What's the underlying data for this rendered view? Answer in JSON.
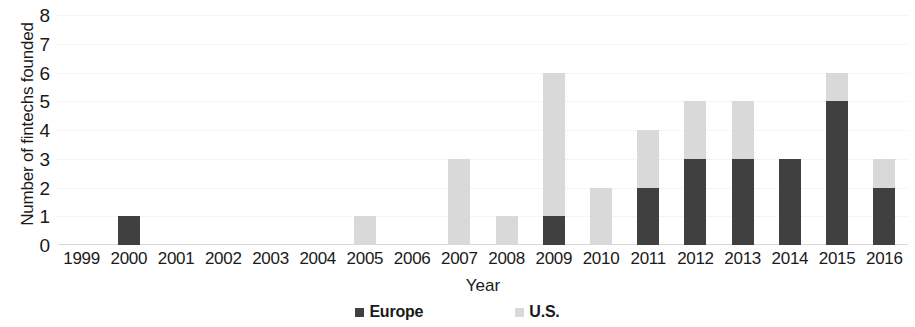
{
  "chart_data": {
    "type": "bar",
    "stacked": true,
    "title": "",
    "xlabel": "Year",
    "ylabel": "Number of fintechs founded",
    "ylim": [
      0,
      8
    ],
    "ytick_labels": [
      "0",
      "1",
      "2",
      "3",
      "4",
      "5",
      "6",
      "7",
      "8"
    ],
    "ytick_values": [
      0,
      1,
      2,
      3,
      4,
      5,
      6,
      7,
      8
    ],
    "grid": true,
    "grid_axis": "y",
    "legend_position": "bottom",
    "categories": [
      "1999",
      "2000",
      "2001",
      "2002",
      "2003",
      "2004",
      "2005",
      "2006",
      "2007",
      "2008",
      "2009",
      "2010",
      "2011",
      "2012",
      "2013",
      "2014",
      "2015",
      "2016"
    ],
    "series": [
      {
        "name": "Europe",
        "color": "#404040",
        "values": [
          0,
          1,
          0,
          0,
          0,
          0,
          0,
          0,
          0,
          0,
          1,
          0,
          2,
          3,
          3,
          3,
          5,
          2
        ]
      },
      {
        "name": "U.S.",
        "color": "#d9d9d9",
        "values": [
          0,
          0,
          0,
          0,
          0,
          0,
          1,
          0,
          3,
          1,
          5,
          2,
          2,
          2,
          2,
          0,
          1,
          1
        ]
      }
    ],
    "totals": [
      0,
      1,
      0,
      0,
      0,
      0,
      1,
      0,
      3,
      1,
      6,
      2,
      4,
      5,
      5,
      3,
      6,
      3
    ]
  },
  "legend": {
    "items": [
      {
        "label": "Europe",
        "swatch": "europe"
      },
      {
        "label": "U.S.",
        "swatch": "us"
      }
    ]
  }
}
